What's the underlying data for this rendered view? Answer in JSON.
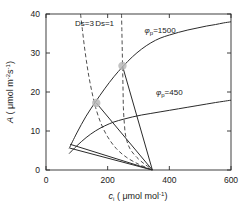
{
  "chart_data": {
    "type": "line",
    "title": "",
    "xlabel": "c_i ( μ mol mol⁻¹)",
    "xlabel_parts": {
      "var": "c",
      "var_sub": "i",
      "units": "( μmol mol",
      "units_sup": "-1",
      "units_close": ")"
    },
    "ylabel": "A ( μmol m⁻²s⁻¹)",
    "ylabel_parts": {
      "var": "A",
      "units_open": "( ",
      "mu": "μ",
      "units": "mol m",
      "sup1": "-2",
      "units2": "s",
      "sup2": "-1",
      "units_close": ")"
    },
    "xlim": [
      0,
      600
    ],
    "ylim": [
      0,
      40
    ],
    "xticks": [
      0,
      200,
      400,
      600
    ],
    "yticks": [
      0,
      10,
      20,
      30,
      40
    ],
    "xticklabels": [
      "0",
      "200",
      "400",
      "600"
    ],
    "yticklabels": [
      "0",
      "10",
      "20",
      "30",
      "40"
    ],
    "grid": false,
    "legend": "none",
    "series": [
      {
        "name": "phi_p=1500",
        "label": "φ",
        "label_sub": "p",
        "label_value": "=1500",
        "style": "solid",
        "role": "assimilation-demand-curve",
        "points": [
          [
            75,
            5.5
          ],
          [
            100,
            9.5
          ],
          [
            130,
            13.8
          ],
          [
            160,
            17.4
          ],
          [
            190,
            20.8
          ],
          [
            220,
            23.9
          ],
          [
            250,
            26.6
          ],
          [
            280,
            29.0
          ],
          [
            310,
            31.0
          ],
          [
            340,
            32.6
          ],
          [
            370,
            33.8
          ],
          [
            400,
            34.6
          ],
          [
            430,
            35.3
          ],
          [
            460,
            35.9
          ],
          [
            490,
            36.4
          ],
          [
            520,
            36.9
          ],
          [
            550,
            37.3
          ],
          [
            575,
            37.7
          ],
          [
            600,
            38.0
          ]
        ],
        "label_pos": [
          370,
          35.2
        ]
      },
      {
        "name": "phi_p=450",
        "label": "φ",
        "label_sub": "p",
        "label_value": "=450",
        "style": "solid",
        "role": "assimilation-demand-curve",
        "points": [
          [
            75,
            4.2
          ],
          [
            100,
            6.2
          ],
          [
            130,
            8.3
          ],
          [
            160,
            10.0
          ],
          [
            190,
            11.3
          ],
          [
            220,
            12.3
          ],
          [
            250,
            13.0
          ],
          [
            280,
            13.6
          ],
          [
            310,
            14.1
          ],
          [
            340,
            14.5
          ],
          [
            370,
            14.9
          ],
          [
            400,
            15.3
          ],
          [
            430,
            15.7
          ],
          [
            460,
            16.1
          ],
          [
            490,
            16.5
          ],
          [
            520,
            16.9
          ],
          [
            550,
            17.3
          ],
          [
            575,
            17.6
          ],
          [
            600,
            17.9
          ]
        ],
        "label_pos": [
          400,
          19.3
        ]
      },
      {
        "name": "Ds=3",
        "label": "Ds=3",
        "style": "dashed",
        "role": "supply-function",
        "points": [
          [
            112,
            40.0
          ],
          [
            118,
            36.0
          ],
          [
            124,
            32.0
          ],
          [
            131,
            28.0
          ],
          [
            139,
            24.0
          ],
          [
            149,
            20.0
          ],
          [
            161,
            16.0
          ],
          [
            178,
            12.0
          ],
          [
            200,
            8.5
          ],
          [
            228,
            5.5
          ],
          [
            262,
            3.2
          ],
          [
            300,
            1.5
          ],
          [
            330,
            0.5
          ],
          [
            345,
            0.0
          ]
        ],
        "label_pos": [
          125,
          37.0
        ]
      },
      {
        "name": "Ds=1",
        "label": "Ds=1",
        "style": "dashed",
        "role": "supply-function",
        "points": [
          [
            245,
            40.0
          ],
          [
            246,
            36.0
          ],
          [
            247,
            32.0
          ],
          [
            248,
            28.0
          ],
          [
            249,
            24.0
          ],
          [
            250,
            20.0
          ],
          [
            251,
            16.0
          ],
          [
            254,
            12.0
          ],
          [
            259,
            8.5
          ],
          [
            272,
            5.5
          ],
          [
            295,
            3.2
          ],
          [
            320,
            1.5
          ],
          [
            338,
            0.5
          ],
          [
            345,
            0.0
          ]
        ],
        "label_pos": [
          190,
          37.0
        ]
      }
    ],
    "operating_points": [
      {
        "name": "op-point-low",
        "x": 163,
        "y": 17.2,
        "color": "#b8b8b8"
      },
      {
        "name": "op-point-high",
        "x": 248,
        "y": 26.7,
        "color": "#b8b8b8"
      }
    ],
    "supply_lines": [
      {
        "name": "supply-line-1",
        "from": [
          345,
          0.0
        ],
        "to": [
          163,
          17.2
        ]
      },
      {
        "name": "supply-line-2",
        "from": [
          345,
          0.0
        ],
        "to": [
          248,
          26.7
        ]
      },
      {
        "name": "supply-line-3",
        "from": [
          345,
          0.0
        ],
        "to": [
          78,
          6.6
        ]
      },
      {
        "name": "supply-line-4",
        "from": [
          345,
          0.0
        ],
        "to": [
          78,
          5.6
        ]
      }
    ],
    "colors": {
      "axis": "#2b2b2b",
      "curve": "#2b2b2b",
      "dashed": "#3a3a3a",
      "marker": "#bdbdbd",
      "text": "#1a1a1a",
      "background": "#ffffff"
    }
  }
}
